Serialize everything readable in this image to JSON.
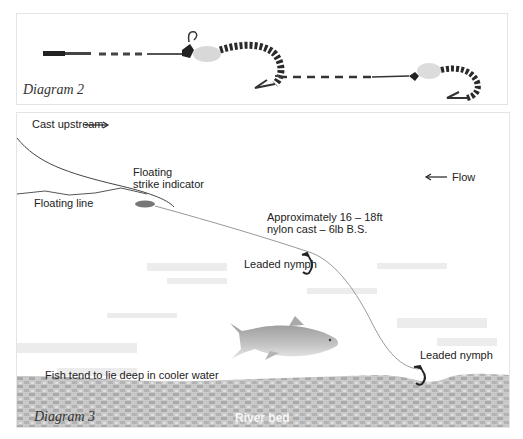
{
  "diagram2": {
    "caption": "Diagram 2"
  },
  "diagram3": {
    "caption": "Diagram 3",
    "labels": {
      "cast_upstream": "Cast upstream",
      "flow": "Flow",
      "floating_strike_indicator_1": "Floating",
      "floating_strike_indicator_2": "strike indicator",
      "floating_line": "Floating line",
      "cast_length_1": "Approximately 16 – 18ft",
      "cast_length_2": "nylon cast – 6lb B.S.",
      "leaded_nymph_upper": "Leaded nymph",
      "leaded_nymph_lower": "Leaded nymph",
      "fish_note": "Fish tend to lie deep in cooler water",
      "river_bed": "River bed"
    },
    "icons": {
      "cast_arrow": "arrow-right",
      "flow_arrow": "arrow-left"
    }
  },
  "colors": {
    "line": "#555555",
    "indicator": "#777777",
    "riverbed": "#b8b8b8",
    "water_texture": "#e6e6e6",
    "fish": "#8a8a8a"
  }
}
